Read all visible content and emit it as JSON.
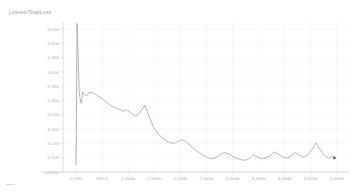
{
  "chart_title": "Losses/TotalLoss",
  "chart_data": {
    "type": "line",
    "title": "Losses/TotalLoss",
    "xlabel": "",
    "ylabel": "",
    "grid": true,
    "legend": false,
    "xlim": [
      -250,
      5250
    ],
    "ylim": [
      0.05,
      0.575
    ],
    "x_tick_labels": [
      "0.000",
      "500.0",
      "1.000k",
      "1.500k",
      "2.000k",
      "2.500k",
      "3.000k",
      "3.500k",
      "4.000k",
      "4.500k",
      "5.000k"
    ],
    "x_tick_values": [
      0,
      500,
      1000,
      1500,
      2000,
      2500,
      3000,
      3500,
      4000,
      4500,
      5000
    ],
    "y_tick_labels": [
      "0.550",
      "0.500",
      "0.450",
      "0.400",
      "0.350",
      "0.300",
      "0.250",
      "0.200",
      "0.150",
      "0.100",
      "0.0500"
    ],
    "y_tick_values": [
      0.55,
      0.5,
      0.45,
      0.4,
      0.35,
      0.3,
      0.25,
      0.2,
      0.15,
      0.1,
      0.05
    ],
    "series": [
      {
        "name": "TotalLoss",
        "color": "#9d9d9d",
        "x": [
          0,
          20,
          40,
          60,
          80,
          100,
          130,
          160,
          200,
          250,
          300,
          360,
          420,
          480,
          540,
          600,
          660,
          720,
          780,
          840,
          900,
          960,
          1020,
          1080,
          1140,
          1200,
          1260,
          1320,
          1400,
          1480,
          1560,
          1640,
          1720,
          1800,
          1880,
          1960,
          2040,
          2120,
          2200,
          2280,
          2360,
          2440,
          2520,
          2600,
          2680,
          2760,
          2840,
          2920,
          3000,
          3080,
          3160,
          3240,
          3320,
          3400,
          3480,
          3560,
          3640,
          3720,
          3800,
          3880,
          3960,
          4040,
          4120,
          4200,
          4280,
          4360,
          4440,
          4520,
          4600,
          4680,
          4760,
          4840,
          4900,
          4950
        ],
        "y": [
          0.075,
          0.57,
          0.46,
          0.33,
          0.305,
          0.29,
          0.33,
          0.322,
          0.316,
          0.327,
          0.329,
          0.324,
          0.316,
          0.31,
          0.302,
          0.292,
          0.283,
          0.278,
          0.273,
          0.268,
          0.262,
          0.268,
          0.263,
          0.252,
          0.246,
          0.252,
          0.268,
          0.283,
          0.245,
          0.208,
          0.186,
          0.172,
          0.16,
          0.153,
          0.15,
          0.158,
          0.163,
          0.155,
          0.141,
          0.128,
          0.117,
          0.108,
          0.1,
          0.096,
          0.101,
          0.11,
          0.118,
          0.114,
          0.105,
          0.098,
          0.093,
          0.091,
          0.097,
          0.11,
          0.102,
          0.096,
          0.099,
          0.107,
          0.12,
          0.112,
          0.102,
          0.099,
          0.106,
          0.118,
          0.109,
          0.101,
          0.11,
          0.128,
          0.152,
          0.128,
          0.108,
          0.098,
          0.104,
          0.1
        ]
      }
    ],
    "endpoint": {
      "x": 4950,
      "y": 0.1
    }
  }
}
